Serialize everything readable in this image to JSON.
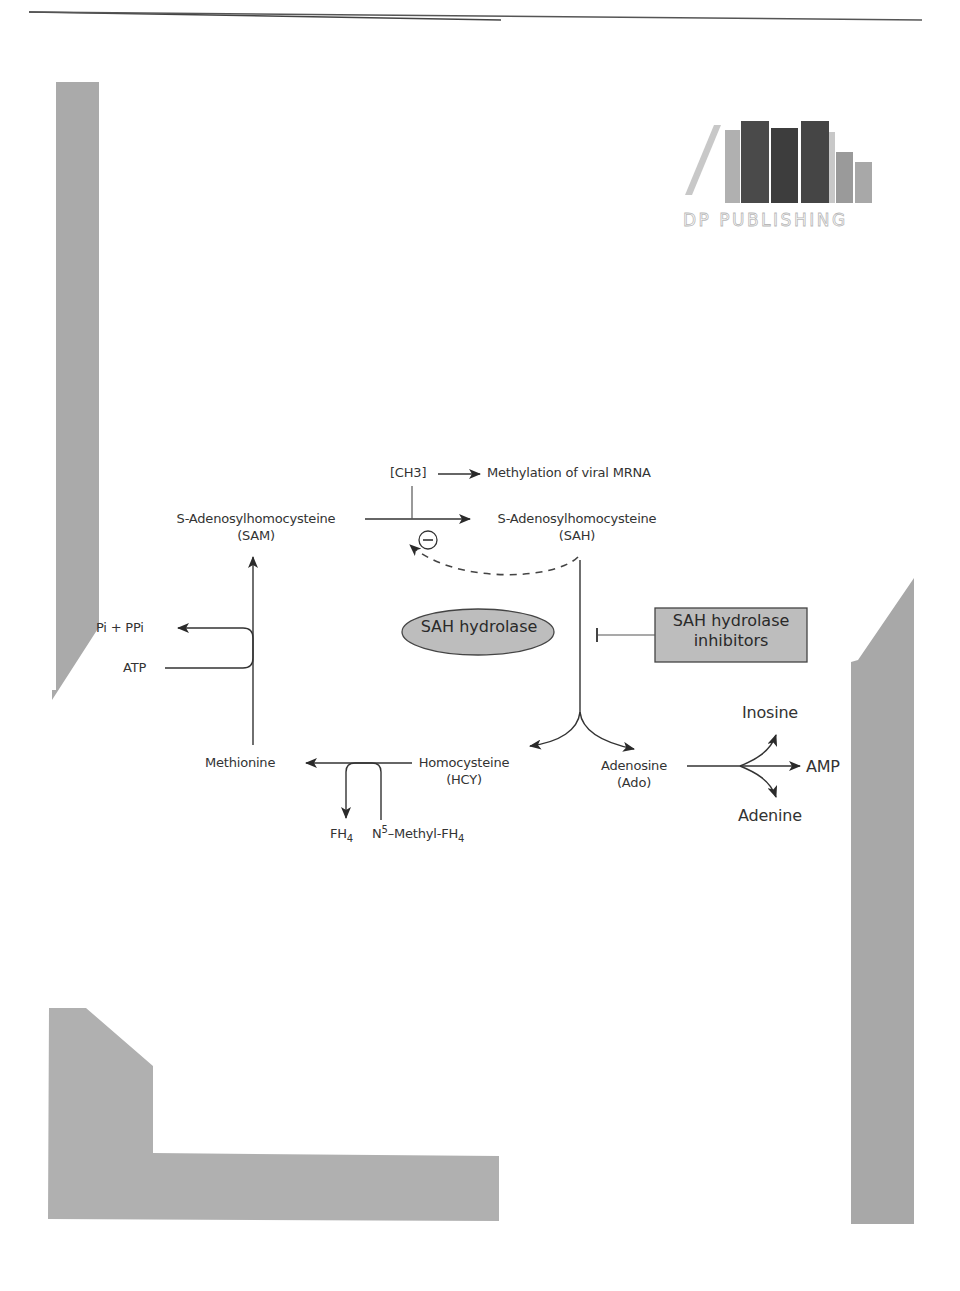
{
  "colors": {
    "page_background": "#ffffff",
    "decor_gray": "#aaaaaa",
    "node_fill": "#bdbdbd",
    "line": "#333333",
    "logo_dark": "#555555",
    "logo_light": "#a8a8a8"
  },
  "logo": {
    "text": "DP PUBLISHING",
    "icon": "books-bars-icon"
  },
  "diagram": {
    "nodes": {
      "ch3": "[CH3]",
      "methylation": "Methylation of viral MRNA",
      "sam_name": "S-Adenosylhomocysteine",
      "sam_abbr": "(SAM)",
      "sah_name": "S-Adenosylhomocysteine",
      "sah_abbr": "(SAH)",
      "inhibition_sign": "−",
      "pi_ppi": "Pi + PPi",
      "atp": "ATP",
      "sah_hydrolase": "SAH hydrolase",
      "sah_inhibitors_line1": "SAH hydrolase",
      "sah_inhibitors_line2": "inhibitors",
      "methionine": "Methionine",
      "homocysteine_name": "Homocysteine",
      "homocysteine_abbr": "(HCY)",
      "adenosine_name": "Adenosine",
      "adenosine_abbr": "(Ado)",
      "fh4_base": "FH",
      "fh4_sub": "4",
      "n5_base": "N",
      "n5_sup": "5",
      "n5_rest": "–Methyl-FH",
      "n5_sub": "4",
      "inosine": "Inosine",
      "amp": "AMP",
      "adenine": "Adenine"
    },
    "edges": [
      {
        "from": "SAM",
        "to": "SAH",
        "type": "arrow"
      },
      {
        "from": "reaction SAM→SAH",
        "to": "[CH3]",
        "type": "line"
      },
      {
        "from": "[CH3]",
        "to": "Methylation of viral MRNA",
        "type": "arrow"
      },
      {
        "from": "SAH",
        "to": "reaction SAM→SAH",
        "type": "dashed-inhibition",
        "label": "−"
      },
      {
        "from": "SAH",
        "to": "Homocysteine",
        "type": "arrow"
      },
      {
        "from": "SAH",
        "to": "Adenosine",
        "type": "arrow"
      },
      {
        "from": "SAH hydrolase inhibitors",
        "to": "SAH→HCY+Ado",
        "type": "inhibit"
      },
      {
        "from": "Homocysteine",
        "to": "Methionine",
        "type": "arrow"
      },
      {
        "from": "N5-Methyl-FH4",
        "to": "FH4",
        "type": "coupled-arrow"
      },
      {
        "from": "Methionine",
        "to": "SAM",
        "type": "arrow"
      },
      {
        "from": "ATP",
        "to": "Pi + PPi",
        "type": "coupled-arrow"
      },
      {
        "from": "Adenosine",
        "to": "Inosine",
        "type": "arrow"
      },
      {
        "from": "Adenosine",
        "to": "AMP",
        "type": "arrow"
      },
      {
        "from": "Adenosine",
        "to": "Adenine",
        "type": "arrow"
      }
    ]
  }
}
